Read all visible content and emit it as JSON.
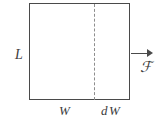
{
  "figure": {
    "background_color": "#ffffff",
    "line_color": "#4a4a4a",
    "dashed_color": "#8d8d8d",
    "text_color": "#3c3c3c"
  },
  "labels": {
    "height": "L",
    "width": "W",
    "width_increment": "dW",
    "width_increment_d": "d",
    "width_increment_W": "W",
    "force": "ℱ"
  },
  "shapes": {
    "rectangle": {
      "name": "film-rectangle",
      "x": 29,
      "y": 3,
      "width": 101,
      "height": 97
    },
    "dashed_divider": {
      "name": "dashed-divider-line",
      "x": 94,
      "y_top": 4,
      "y_bottom": 100,
      "style": "dashed"
    },
    "arrow": {
      "name": "force-arrow",
      "x_start": 131,
      "x_end": 153,
      "y": 53,
      "direction": "right"
    }
  }
}
